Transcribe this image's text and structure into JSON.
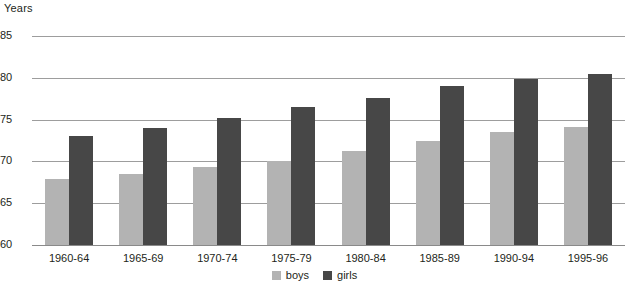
{
  "chart_data": {
    "type": "bar",
    "title": "",
    "subtitle": "",
    "xlabel": "",
    "ylabel": "Years",
    "ylim": [
      60,
      85
    ],
    "yticks": [
      60,
      65,
      70,
      75,
      80,
      85
    ],
    "ytick_labels": [
      "60",
      "65",
      "70",
      "75",
      "80",
      "85"
    ],
    "grid": true,
    "legend_position": "bottom-center",
    "categories": [
      "1960-64",
      "1965-69",
      "1970-74",
      "1975-79",
      "1980-84",
      "1985-89",
      "1990-94",
      "1995-96"
    ],
    "series": [
      {
        "name": "boys",
        "color": "#b3b3b3",
        "values": [
          67.9,
          68.5,
          69.3,
          70.1,
          71.2,
          72.4,
          73.5,
          74.1
        ]
      },
      {
        "name": "girls",
        "color": "#474747",
        "values": [
          73.0,
          74.0,
          75.2,
          76.5,
          77.6,
          79.0,
          79.9,
          80.5
        ]
      }
    ]
  },
  "axis": {
    "y_title": "Years"
  },
  "legend": {
    "items": [
      {
        "label": "boys",
        "color": "#b3b3b3"
      },
      {
        "label": "girls",
        "color": "#474747"
      }
    ]
  },
  "colors": {
    "boys": "#b3b3b3",
    "girls": "#474747",
    "grid": "#9d9d9d",
    "text": "#231f20",
    "background": "#ffffff"
  }
}
